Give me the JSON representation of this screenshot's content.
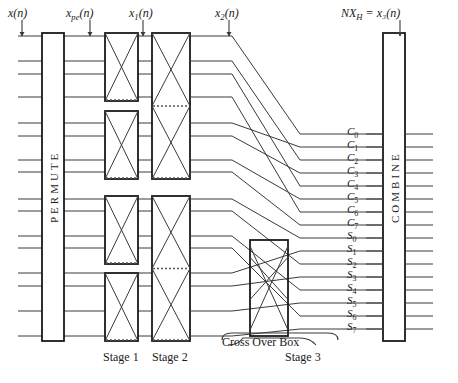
{
  "diagram": {
    "title_labels": {
      "input": "x(n)",
      "input_sub": "",
      "permuted": "x_pe(n)",
      "stage1_out": "x_1(n)",
      "stage2_out": "x_2(n)",
      "stage3_out": "NX_H = x_3(n)"
    },
    "top_labels": [
      {
        "id": "x-of-n",
        "base": "x",
        "sub": "",
        "tail": "(n)",
        "x": 8,
        "y": 6,
        "tick_x": 22,
        "tick_y": 20
      },
      {
        "id": "x-pe-of-n",
        "base": "x",
        "sub": "pe",
        "tail": "(n)",
        "x": 66,
        "y": 6,
        "tick_x": 90,
        "tick_y": 20
      },
      {
        "id": "x-1-of-n",
        "base": "x",
        "sub": "1",
        "tail": "(n)",
        "x": 129,
        "y": 6,
        "tick_x": 143,
        "tick_y": 20
      },
      {
        "id": "x-2-of-n",
        "base": "x",
        "sub": "2",
        "tail": "(n)",
        "x": 215,
        "y": 6,
        "tick_x": 229,
        "tick_y": 20
      },
      {
        "id": "nxh-x-3-of-n",
        "base": "NX",
        "sub": "H",
        "tail": " = x₃(n)",
        "x": 341,
        "y": 6,
        "tick_x": 400,
        "tick_y": 20
      }
    ],
    "blocks": {
      "permute": {
        "label": "PERMUTE",
        "x": 42,
        "y": 33,
        "w": 22,
        "h": 308
      },
      "combine": {
        "label": "COMBINE",
        "x": 383,
        "y": 33,
        "w": 22,
        "h": 308
      }
    },
    "cross_over_box": {
      "label": "Cross Over Box",
      "x": 250,
      "y": 240,
      "w": 38,
      "h": 96
    },
    "stage_labels": [
      {
        "id": "stage-1",
        "text": "Stage 1",
        "x": 103,
        "y": 352
      },
      {
        "id": "stage-2",
        "text": "Stage 2",
        "x": 152,
        "y": 352
      },
      {
        "id": "stage-3",
        "text": "Stage 3",
        "x": 285,
        "y": 352
      }
    ],
    "stage1_boxes": [
      {
        "x": 105,
        "y": 33,
        "w": 33,
        "h": 68
      },
      {
        "x": 105,
        "y": 111,
        "w": 33,
        "h": 68
      },
      {
        "x": 105,
        "y": 196,
        "w": 33,
        "h": 68
      },
      {
        "x": 105,
        "y": 273,
        "w": 33,
        "h": 68
      }
    ],
    "stage2_boxes": [
      {
        "x": 152,
        "y": 33,
        "w": 38,
        "h": 146
      },
      {
        "x": 152,
        "y": 196,
        "w": 38,
        "h": 145
      }
    ],
    "output_labels": [
      {
        "id": "C0",
        "base": "C",
        "sub": "0",
        "y": 134
      },
      {
        "id": "C1",
        "base": "C",
        "sub": "1",
        "y": 147
      },
      {
        "id": "C2",
        "base": "C",
        "sub": "2",
        "y": 160
      },
      {
        "id": "C3",
        "base": "C",
        "sub": "3",
        "y": 173
      },
      {
        "id": "C4",
        "base": "C",
        "sub": "4",
        "y": 186
      },
      {
        "id": "C5",
        "base": "C",
        "sub": "5",
        "y": 199
      },
      {
        "id": "C6",
        "base": "C",
        "sub": "6",
        "y": 212
      },
      {
        "id": "C7",
        "base": "C",
        "sub": "7",
        "y": 225
      },
      {
        "id": "S0",
        "base": "S",
        "sub": "0",
        "y": 238
      },
      {
        "id": "S1",
        "base": "S",
        "sub": "1",
        "y": 251
      },
      {
        "id": "S2",
        "base": "S",
        "sub": "2",
        "y": 264
      },
      {
        "id": "S3",
        "base": "S",
        "sub": "3",
        "y": 277
      },
      {
        "id": "S4",
        "base": "S",
        "sub": "4",
        "y": 290
      },
      {
        "id": "S5",
        "base": "S",
        "sub": "5",
        "y": 303
      },
      {
        "id": "S6",
        "base": "S",
        "sub": "6",
        "y": 316
      },
      {
        "id": "S7",
        "base": "S",
        "sub": "7",
        "y": 329
      }
    ],
    "colors": {
      "line": "#3a3a3a",
      "box_stroke": "#1a1a1a",
      "background": "#ffffff",
      "dashed": "#555555"
    },
    "line_count": 16,
    "bus_y": [
      36,
      61,
      74,
      97,
      123,
      136,
      160,
      172,
      199,
      211,
      236,
      248,
      273,
      286,
      311,
      336
    ]
  }
}
